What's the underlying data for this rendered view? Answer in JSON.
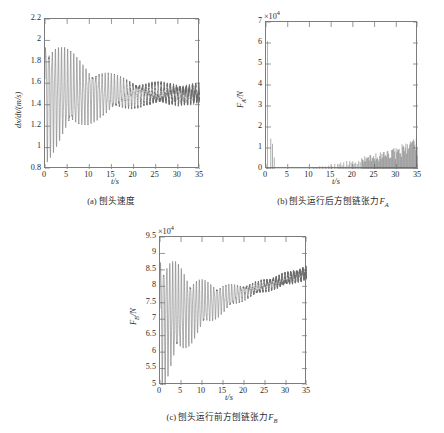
{
  "figure": {
    "background": "#ffffff",
    "line_color": "#6b6b6b",
    "axis_color": "#7c7c7c"
  },
  "chart_data": [
    {
      "id": "panel-a",
      "type": "line",
      "title": "",
      "caption": "(a) 刨头速度",
      "caption_prefix": "(a)",
      "caption_text": "刨头速度",
      "xlabel": "t/s",
      "ylabel": "dx/dt/(m/s)",
      "exponent": "",
      "xlim": [
        0,
        35
      ],
      "ylim": [
        0.8,
        2.2
      ],
      "xticks": [
        0,
        5,
        10,
        15,
        20,
        25,
        30,
        35
      ],
      "yticks": [
        0.8,
        1,
        1.2,
        1.4,
        1.6,
        1.8,
        2,
        2.2
      ],
      "ytick_labels": [
        "0.8",
        "1",
        "1.2",
        "1.4",
        "1.6",
        "1.8",
        "2",
        "2.2"
      ],
      "xtick_labels": [
        "0",
        "5",
        "10",
        "15",
        "20",
        "25",
        "30",
        "35"
      ],
      "grid": false,
      "legend": "none",
      "series": [
        {
          "name": "planer head velocity",
          "mean_start": 1.5,
          "mean_end": 1.5,
          "amp_start": 0.52,
          "amp_end": 0.055,
          "decay_knee_t": 22.5,
          "amp_at_knee": 0.085,
          "freq_hz": 1.42,
          "noise_start": 0.004,
          "noise_end": 0.03,
          "description": "Damped oscillation starting near 1.0-2.02 envelope, decaying to a noisy band about 1.44-1.56"
        }
      ]
    },
    {
      "id": "panel-b",
      "type": "line",
      "caption": "(b) 刨头运行后方刨链张力F_A",
      "caption_prefix": "(b)",
      "caption_text": "刨头运行后方刨链张力",
      "caption_symbol": "F",
      "caption_symbol_sub": "A",
      "xlabel": "t/s",
      "ylabel": "F_A/N",
      "ylabel_symbol": "F",
      "ylabel_sub": "A",
      "ylabel_unit": "/N",
      "exponent": "×10",
      "exponent_power": "4",
      "xlim": [
        0,
        35
      ],
      "ylim": [
        0,
        7
      ],
      "xticks": [
        0,
        5,
        10,
        15,
        20,
        25,
        30,
        35
      ],
      "yticks": [
        0,
        1,
        2,
        3,
        4,
        5,
        6,
        7
      ],
      "ytick_labels": [
        "0",
        "1",
        "2",
        "3",
        "4",
        "5",
        "6",
        "7"
      ],
      "xtick_labels": [
        "0",
        "5",
        "10",
        "15",
        "20",
        "25",
        "30",
        "35"
      ],
      "grid": false,
      "legend": "none",
      "series": [
        {
          "name": "rear chain tension",
          "initial_spike_value": 6.1,
          "initial_spike_t": 0.35,
          "secondary_spikes_t": [
            1.1,
            1.5,
            1.9
          ],
          "secondary_spikes_value": [
            1.45,
            1.2,
            0.55
          ],
          "quiet_until_t": 11.0,
          "onset_t": 11.0,
          "growth_end_t": 35.0,
          "peak_at_onset": 0.12,
          "peak_at_end": 1.45,
          "baseline": 0.0,
          "freq_hz": 1.45,
          "description": "Near-zero with a large spike at t~0.4 reaching 6.1e4, then sparse rectified bursts growing from t=11s to ~1.4e4 at t=35s"
        }
      ]
    },
    {
      "id": "panel-c",
      "type": "line",
      "caption": "(c) 刨头运行前方刨链张力F_B",
      "caption_prefix": "(c)",
      "caption_text": "刨头运行前方刨链张力",
      "caption_symbol": "F",
      "caption_symbol_sub": "B",
      "xlabel": "t/s",
      "ylabel": "F_B/N",
      "ylabel_symbol": "F",
      "ylabel_sub": "B",
      "ylabel_unit": "/N",
      "exponent": "×10",
      "exponent_power": "4",
      "xlim": [
        0,
        35
      ],
      "ylim": [
        5,
        9.5
      ],
      "xticks": [
        0,
        5,
        10,
        15,
        20,
        25,
        30,
        35
      ],
      "yticks": [
        5,
        5.5,
        6,
        6.5,
        7,
        7.5,
        8,
        8.5,
        9,
        9.5
      ],
      "ytick_labels": [
        "5",
        "5.5",
        "6",
        "6.5",
        "7",
        "7.5",
        "8",
        "8.5",
        "9",
        "9.5"
      ],
      "xtick_labels": [
        "0",
        "5",
        "10",
        "15",
        "20",
        "25",
        "30",
        "35"
      ],
      "grid": false,
      "legend": "none",
      "series": [
        {
          "name": "front chain tension",
          "mean_start": 7.02,
          "mean_end": 8.42,
          "amp_start": 1.85,
          "amp_at_knee": 0.16,
          "decay_knee_t": 22.0,
          "amp_end": 0.14,
          "freq_hz": 1.42,
          "noise_start": 0.01,
          "noise_end": 0.07,
          "description": "Damped oscillation about a linearly rising mean from 7.0e4 to 8.4e4, envelope shrinking from 1.85e4 to ~0.15e4"
        }
      ]
    }
  ]
}
